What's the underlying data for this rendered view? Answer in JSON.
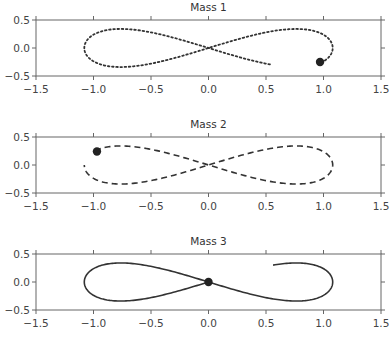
{
  "figure": {
    "width": 391,
    "height": 343
  },
  "chart_data": [
    {
      "type": "line",
      "title": "Mass 1",
      "xlim": [
        -1.5,
        1.5
      ],
      "ylim": [
        -0.5,
        0.5
      ],
      "xticks": [
        "-1.5",
        "-1.0",
        "-0.5",
        "0.0",
        "0.5",
        "1.0",
        "1.5"
      ],
      "yticks": [
        "0.5",
        "0.0",
        "-0.5"
      ],
      "line_style": "dotted",
      "trajectory": "figure-eight",
      "t_range": [
        0.0,
        0.92
      ],
      "phase_offset": 0.3333,
      "marker": {
        "x": 0.97,
        "y": -0.25
      },
      "curve_end": {
        "x": 0.53,
        "y": -0.36
      }
    },
    {
      "type": "line",
      "title": "Mass 2",
      "xlim": [
        -1.5,
        1.5
      ],
      "ylim": [
        -0.5,
        0.5
      ],
      "xticks": [
        "-1.5",
        "-1.0",
        "-0.5",
        "0.0",
        "0.5",
        "1.0",
        "1.5"
      ],
      "yticks": [
        "0.5",
        "0.0",
        "-0.5"
      ],
      "line_style": "dashed",
      "trajectory": "figure-eight",
      "t_range": [
        0.0,
        0.92
      ],
      "phase_offset": 0.6667,
      "marker": {
        "x": -0.97,
        "y": 0.24
      },
      "curve_end": {
        "x": -1.06,
        "y": 0.0
      }
    },
    {
      "type": "line",
      "title": "Mass 3",
      "xlim": [
        -1.5,
        1.5
      ],
      "ylim": [
        -0.5,
        0.5
      ],
      "xticks": [
        "-1.5",
        "-1.0",
        "-0.5",
        "0.0",
        "0.5",
        "1.0",
        "1.5"
      ],
      "yticks": [
        "0.5",
        "0.0",
        "-0.5"
      ],
      "line_style": "solid",
      "trajectory": "figure-eight",
      "t_range": [
        0.0,
        0.92
      ],
      "phase_offset": 0.0,
      "marker": {
        "x": 0.0,
        "y": 0.0
      },
      "curve_end": {
        "x": 0.55,
        "y": 0.33
      }
    }
  ],
  "style": {
    "line_color": "#333333",
    "axis_color": "#666666",
    "marker_color": "#222222"
  }
}
